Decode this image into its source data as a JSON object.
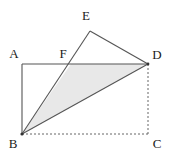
{
  "figure": {
    "type": "geometry-diagram",
    "background_color": "#ffffff",
    "stroke_color": "#555555",
    "label_color": "#1a1a1a",
    "shaded_fill_color": "#e8e8e8",
    "canvas": {
      "width": 171,
      "height": 160
    }
  },
  "points": {
    "A": {
      "label": "A",
      "x": 22,
      "y": 64,
      "label_x": 14,
      "label_y": 55
    },
    "B": {
      "label": "B",
      "x": 22,
      "y": 134,
      "label_x": 13,
      "label_y": 145
    },
    "C": {
      "label": "C",
      "x": 148,
      "y": 134,
      "label_x": 157,
      "label_y": 145
    },
    "D": {
      "label": "D",
      "x": 148,
      "y": 64,
      "label_x": 157,
      "label_y": 56
    },
    "E": {
      "label": "E",
      "x": 90,
      "y": 31,
      "label_x": 86,
      "label_y": 17
    },
    "F": {
      "label": "F",
      "x": 71,
      "y": 64,
      "label_x": 63,
      "label_y": 55
    }
  },
  "segments": [
    {
      "name": "segment-AD",
      "from": "A",
      "to": "D",
      "style": "solid"
    },
    {
      "name": "segment-AB",
      "from": "A",
      "to": "B",
      "style": "solid"
    },
    {
      "name": "segment-BC",
      "from": "B",
      "to": "C",
      "style": "dashed"
    },
    {
      "name": "segment-DC",
      "from": "D",
      "to": "C",
      "style": "dashed"
    },
    {
      "name": "segment-BE",
      "from": "B",
      "to": "E",
      "style": "solid"
    },
    {
      "name": "segment-ED",
      "from": "E",
      "to": "D",
      "style": "solid"
    },
    {
      "name": "segment-BD",
      "from": "B",
      "to": "D",
      "style": "solid"
    }
  ],
  "shaded_region": {
    "name": "triangle-BFD",
    "vertices": [
      "B",
      "F",
      "D"
    ],
    "fill": "#e8e8e8"
  }
}
